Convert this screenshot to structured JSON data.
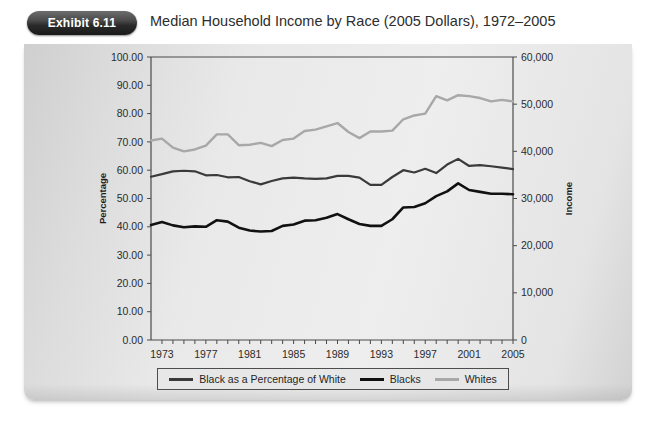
{
  "header": {
    "badge_label": "Exhibit 6.11",
    "title": "Median Household Income by Race (2005 Dollars), 1972–2005"
  },
  "colors": {
    "percent_line": "#3a3a3a",
    "blacks_line": "#111111",
    "whites_line": "#a8a8a8",
    "card_background": "#e6e6e6",
    "badge_background": "#2a2a2a",
    "axis": "#4a4a4a",
    "text": "#2b2b2b"
  },
  "legend": {
    "items": [
      {
        "label": "Black as a Percentage of White",
        "color": "#3a3a3a",
        "width": 3
      },
      {
        "label": "Blacks",
        "color": "#111111",
        "width": 3.4
      },
      {
        "label": "Whites",
        "color": "#a8a8a8",
        "width": 3
      }
    ]
  },
  "axes": {
    "left_title": "Percentage",
    "right_title": "Income",
    "left_ticks": [
      "100.00",
      "90.00",
      "80.00",
      "70.00",
      "60.00",
      "50.00",
      "40.00",
      "30.00",
      "20.00",
      "10.00",
      "0.00"
    ],
    "right_ticks": [
      "60,000",
      "50,000",
      "40,000",
      "30,000",
      "20,000",
      "10,000",
      "0"
    ],
    "x_ticks": [
      "1973",
      "1977",
      "1981",
      "1985",
      "1989",
      "1993",
      "1997",
      "2001",
      "2005"
    ]
  },
  "chart_data": {
    "type": "line",
    "title": "Median Household Income by Race (2005 Dollars), 1972–2005",
    "xlabel": "",
    "ylabel": "Percentage",
    "y2label": "Income",
    "ylim": [
      0,
      100
    ],
    "y2lim": [
      0,
      60000
    ],
    "xlim": [
      1972,
      2005
    ],
    "grid": false,
    "legend_position": "bottom",
    "x": [
      1972,
      1973,
      1974,
      1975,
      1976,
      1977,
      1978,
      1979,
      1980,
      1981,
      1982,
      1983,
      1984,
      1985,
      1986,
      1987,
      1988,
      1989,
      1990,
      1991,
      1992,
      1993,
      1994,
      1995,
      1996,
      1997,
      1998,
      1999,
      2000,
      2001,
      2002,
      2003,
      2004,
      2005
    ],
    "series": [
      {
        "name": "Black as a Percentage of White",
        "axis": "left",
        "color": "#3a3a3a",
        "units": "percent",
        "values": [
          57.7,
          58.6,
          59.6,
          59.8,
          59.6,
          58.2,
          58.3,
          57.5,
          57.6,
          56.1,
          55.0,
          56.2,
          57.1,
          57.4,
          57.1,
          56.9,
          57.1,
          58.0,
          58.0,
          57.4,
          54.8,
          54.8,
          57.6,
          60.0,
          59.2,
          60.5,
          59.0,
          62.0,
          64.0,
          61.5,
          61.8,
          61.4,
          60.9,
          60.4
        ]
      },
      {
        "name": "Blacks",
        "axis": "right",
        "color": "#111111",
        "units": "dollars",
        "values": [
          24400,
          25000,
          24300,
          23900,
          24100,
          24000,
          25400,
          25100,
          23800,
          23200,
          23000,
          23100,
          24200,
          24500,
          25300,
          25400,
          25900,
          26700,
          25600,
          24600,
          24200,
          24200,
          25600,
          28100,
          28200,
          29000,
          30500,
          31500,
          33200,
          31800,
          31400,
          31000,
          31000,
          30900
        ]
      },
      {
        "name": "Whites",
        "axis": "right",
        "color": "#a8a8a8",
        "units": "dollars",
        "values": [
          42300,
          42700,
          40800,
          40000,
          40400,
          41200,
          43600,
          43600,
          41300,
          41400,
          41800,
          41100,
          42400,
          42700,
          44300,
          44600,
          45300,
          46000,
          44100,
          42800,
          44200,
          44200,
          44400,
          46800,
          47600,
          48000,
          51700,
          50800,
          51900,
          51700,
          51300,
          50600,
          50900,
          50600
        ]
      }
    ]
  }
}
